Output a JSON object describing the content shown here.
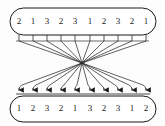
{
  "figure": {
    "type": "bipartite-routing-diagram",
    "colors": {
      "background": "#fdfdfd",
      "outline": "#1a1a1a",
      "line": "#2b2b2b",
      "text": "#1a1a1a"
    },
    "top_row": {
      "name": "input-register",
      "count": 10,
      "values": [
        "2",
        "1",
        "3",
        "2",
        "3",
        "1",
        "2",
        "3",
        "2",
        "1"
      ]
    },
    "bottom_row": {
      "name": "output-register",
      "count": 10,
      "values": [
        "1",
        "2",
        "3",
        "2",
        "1",
        "3",
        "2",
        "3",
        "1",
        "2"
      ]
    },
    "connectors": {
      "count": 10,
      "arrowheads": true,
      "direction": "top-to-bottom",
      "crossing_point": {
        "x": 82,
        "y": 63
      }
    },
    "geometry": {
      "top_box": {
        "x": 10,
        "y": 8,
        "width": 146,
        "height": 27
      },
      "bottom_box": {
        "x": 10,
        "y": 96,
        "width": 146,
        "height": 26
      },
      "slot_x": [
        19,
        33,
        47,
        61,
        75,
        90,
        104,
        118,
        132,
        146
      ],
      "stub_bottom_y": 41,
      "fan_bus_y": 94
    }
  }
}
